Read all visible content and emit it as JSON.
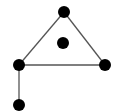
{
  "diagram": {
    "type": "graph",
    "background": "#ffffff",
    "node_color": "#000000",
    "edge_color": "#555555",
    "node_radius": 6,
    "nodes": [
      {
        "id": "top",
        "x": 64,
        "y": 12
      },
      {
        "id": "center",
        "x": 63,
        "y": 43
      },
      {
        "id": "left",
        "x": 19,
        "y": 65
      },
      {
        "id": "right",
        "x": 105,
        "y": 65
      },
      {
        "id": "bottom",
        "x": 19,
        "y": 105
      }
    ],
    "edges": [
      {
        "from": "top",
        "to": "left"
      },
      {
        "from": "top",
        "to": "right"
      },
      {
        "from": "left",
        "to": "right"
      },
      {
        "from": "left",
        "to": "bottom"
      }
    ]
  }
}
